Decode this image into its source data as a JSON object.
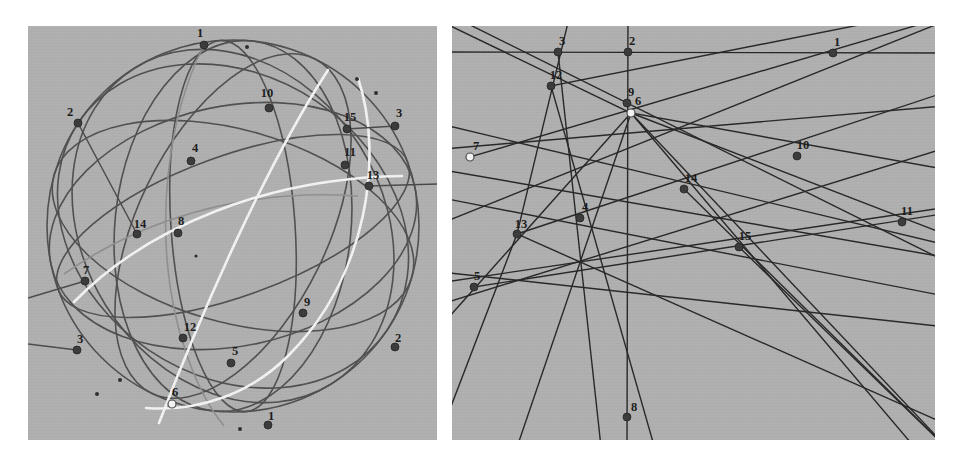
{
  "figure": {
    "background_color": "#ffffff",
    "panel_background_color": "#b0b0b0",
    "curve_color": "#4a4a4a",
    "line_color": "#2b2b2b",
    "highlight_color": "#f2f2f2",
    "point_fill_color": "#3a3a3a",
    "hollow_point_fill_color": "#f5f5f5",
    "label_color": "#1a1a1a",
    "panels": [
      {
        "name": "left-sphere-panel",
        "x": 28,
        "y": 26,
        "width": 409,
        "height": 414
      },
      {
        "name": "right-line-panel",
        "x": 452,
        "y": 26,
        "width": 483,
        "height": 414
      }
    ]
  },
  "left_panel": {
    "name": "sphere-great-circle-diagram",
    "sphere": {
      "cx": 205,
      "cy": 200,
      "r": 186
    },
    "points": [
      {
        "id": "L1a",
        "label": "1",
        "x": 176,
        "y": 19,
        "lx": 172,
        "ly": 11,
        "style": "filled"
      },
      {
        "id": "L2a",
        "label": "2",
        "x": 50,
        "y": 97,
        "lx": 42,
        "ly": 90,
        "style": "filled"
      },
      {
        "id": "L10",
        "label": "10",
        "x": 241,
        "y": 82,
        "lx": 239,
        "ly": 71,
        "style": "filled"
      },
      {
        "id": "L15",
        "label": "15",
        "x": 319,
        "y": 103,
        "lx": 322,
        "ly": 95,
        "style": "filled"
      },
      {
        "id": "L3a",
        "label": "3",
        "x": 367,
        "y": 100,
        "lx": 371,
        "ly": 91,
        "style": "filled"
      },
      {
        "id": "L4",
        "label": "4",
        "x": 163,
        "y": 135,
        "lx": 167,
        "ly": 126,
        "style": "filled"
      },
      {
        "id": "L11",
        "label": "11",
        "x": 317,
        "y": 139,
        "lx": 322,
        "ly": 130,
        "style": "filled"
      },
      {
        "id": "L13",
        "label": "13",
        "x": 341,
        "y": 160,
        "lx": 345,
        "ly": 153,
        "style": "filled"
      },
      {
        "id": "L14",
        "label": "14",
        "x": 109,
        "y": 208,
        "lx": 112,
        "ly": 202,
        "style": "filled"
      },
      {
        "id": "L8",
        "label": "8",
        "x": 150,
        "y": 207,
        "lx": 153,
        "ly": 199,
        "style": "filled"
      },
      {
        "id": "L7",
        "label": "7",
        "x": 57,
        "y": 255,
        "lx": 58,
        "ly": 248,
        "style": "filled"
      },
      {
        "id": "L9",
        "label": "9",
        "x": 275,
        "y": 287,
        "lx": 279,
        "ly": 280,
        "style": "filled"
      },
      {
        "id": "L3b",
        "label": "3",
        "x": 49,
        "y": 324,
        "lx": 52,
        "ly": 317,
        "style": "filled"
      },
      {
        "id": "L2b",
        "label": "2",
        "x": 367,
        "y": 321,
        "lx": 370,
        "ly": 316,
        "style": "filled"
      },
      {
        "id": "L12",
        "label": "12",
        "x": 155,
        "y": 312,
        "lx": 162,
        "ly": 305,
        "style": "filled"
      },
      {
        "id": "L5",
        "label": "5",
        "x": 203,
        "y": 337,
        "lx": 207,
        "ly": 329,
        "style": "filled"
      },
      {
        "id": "L6",
        "label": "6",
        "x": 144,
        "y": 378,
        "lx": 147,
        "ly": 370,
        "style": "hollow"
      },
      {
        "id": "L1b",
        "label": "1",
        "x": 240,
        "y": 399,
        "lx": 243,
        "ly": 394,
        "style": "filled"
      }
    ]
  },
  "right_panel": {
    "name": "projective-line-arrangement-diagram",
    "points": [
      {
        "id": "R3",
        "label": "3",
        "x": 106,
        "y": 26,
        "lx": 110,
        "ly": 19,
        "style": "filled"
      },
      {
        "id": "R2",
        "label": "2",
        "x": 176,
        "y": 26,
        "lx": 180,
        "ly": 19,
        "style": "filled"
      },
      {
        "id": "R1",
        "label": "1",
        "x": 381,
        "y": 27,
        "lx": 385,
        "ly": 20,
        "style": "filled"
      },
      {
        "id": "R12",
        "label": "12",
        "x": 99,
        "y": 60,
        "lx": 104,
        "ly": 53,
        "style": "filled"
      },
      {
        "id": "R9",
        "label": "9",
        "x": 175,
        "y": 77,
        "lx": 179,
        "ly": 70,
        "style": "filled"
      },
      {
        "id": "R6",
        "label": "6",
        "x": 179,
        "y": 87,
        "lx": 186,
        "ly": 79,
        "style": "hollow"
      },
      {
        "id": "R7",
        "label": "7",
        "x": 18,
        "y": 131,
        "lx": 24,
        "ly": 124,
        "style": "hollow"
      },
      {
        "id": "R10",
        "label": "10",
        "x": 345,
        "y": 130,
        "lx": 351,
        "ly": 123,
        "style": "filled"
      },
      {
        "id": "R14",
        "label": "14",
        "x": 232,
        "y": 163,
        "lx": 239,
        "ly": 156,
        "style": "filled"
      },
      {
        "id": "R4",
        "label": "4",
        "x": 128,
        "y": 192,
        "lx": 133,
        "ly": 185,
        "style": "filled"
      },
      {
        "id": "R13",
        "label": "13",
        "x": 65,
        "y": 208,
        "lx": 69,
        "ly": 202,
        "style": "filled"
      },
      {
        "id": "R11",
        "label": "11",
        "x": 450,
        "y": 196,
        "lx": 455,
        "ly": 189,
        "style": "filled"
      },
      {
        "id": "R15",
        "label": "15",
        "x": 287,
        "y": 221,
        "lx": 293,
        "ly": 214,
        "style": "filled"
      },
      {
        "id": "R5",
        "label": "5",
        "x": 22,
        "y": 261,
        "lx": 25,
        "ly": 254,
        "style": "filled"
      },
      {
        "id": "R8",
        "label": "8",
        "x": 175,
        "y": 391,
        "lx": 182,
        "ly": 385,
        "style": "filled"
      }
    ]
  },
  "chart_data": {
    "type": "scatter",
    "title": "",
    "xlabel": "",
    "ylabel": "",
    "description_left": "Sphere with great circles through 15 labelled incidence points (labels 1,2,3 appear twice as antipodal pairs).",
    "description_right": "Planar line arrangement with 15 labelled incidence points.",
    "left_labels": [
      "1",
      "2",
      "10",
      "15",
      "3",
      "4",
      "11",
      "13",
      "14",
      "8",
      "7",
      "9",
      "3",
      "2",
      "12",
      "5",
      "6",
      "1"
    ],
    "right_labels": [
      "3",
      "2",
      "1",
      "12",
      "9",
      "6",
      "7",
      "10",
      "14",
      "4",
      "13",
      "11",
      "15",
      "5",
      "8"
    ],
    "point_count_left": 18,
    "point_count_right": 15,
    "hollow_points_left": [
      "6"
    ],
    "hollow_points_right": [
      "6",
      "7"
    ]
  }
}
